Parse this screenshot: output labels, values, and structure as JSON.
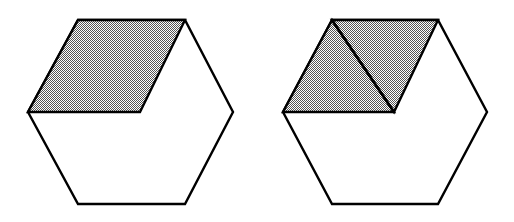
{
  "figure": {
    "background_color": "#ffffff",
    "stroke_color": "#000000",
    "stroke_width": 2.4,
    "shade_color": "#808080",
    "shade_pattern": "50-percent-dither-checkerboard",
    "canvas": {
      "width": 514,
      "height": 222
    },
    "panels": [
      {
        "id": "left-panel",
        "name": "hexagon-undivided",
        "label": "",
        "hexagon": {
          "name": "hexagon-outline",
          "orientation": "flat-top",
          "points": "78,20 185,20 233,112 185,204 78,204 28,112",
          "vertices": [
            {
              "name": "top-left",
              "x": 78,
              "y": 20
            },
            {
              "name": "top-right",
              "x": 185,
              "y": 20
            },
            {
              "name": "right",
              "x": 233,
              "y": 112
            },
            {
              "name": "bottom-right",
              "x": 185,
              "y": 204
            },
            {
              "name": "bottom-left",
              "x": 78,
              "y": 204
            },
            {
              "name": "left",
              "x": 28,
              "y": 112
            }
          ]
        },
        "shaded_regions": [
          {
            "name": "shaded-rhombus",
            "shape": "rhombus",
            "points": "78,20 185,20 140,112 28,112",
            "fill": "#808080"
          }
        ],
        "divider_lines": []
      },
      {
        "id": "right-panel",
        "name": "hexagon-divided",
        "label": "",
        "hexagon": {
          "name": "hexagon-outline",
          "orientation": "flat-top",
          "points": "332,20 438,20 487,112 438,204 332,204 283,112",
          "vertices": [
            {
              "name": "top-left",
              "x": 332,
              "y": 20
            },
            {
              "name": "top-right",
              "x": 438,
              "y": 20
            },
            {
              "name": "right",
              "x": 487,
              "y": 112
            },
            {
              "name": "bottom-right",
              "x": 438,
              "y": 204
            },
            {
              "name": "bottom-left",
              "x": 332,
              "y": 204
            },
            {
              "name": "left",
              "x": 283,
              "y": 112
            }
          ]
        },
        "shaded_regions": [
          {
            "name": "shaded-triangle-left",
            "shape": "triangle",
            "points": "332,20 394,112 283,112",
            "fill": "#808080"
          },
          {
            "name": "shaded-triangle-right",
            "shape": "triangle",
            "points": "332,20 438,20 394,112",
            "fill": "#808080"
          }
        ],
        "divider_lines": [
          {
            "name": "rhombus-diagonal",
            "x1": 332,
            "y1": 20,
            "x2": 394,
            "y2": 112
          }
        ]
      }
    ]
  }
}
